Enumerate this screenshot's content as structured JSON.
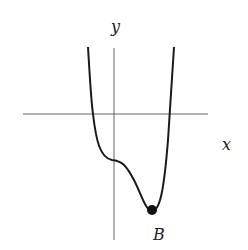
{
  "diagram": {
    "axes": {
      "x_label": "x",
      "y_label": "y"
    },
    "point": {
      "label": "B",
      "description": "local minimum"
    },
    "colors": {
      "axis": "#555555",
      "curve": "#1a1a1a",
      "point": "#111111"
    }
  }
}
